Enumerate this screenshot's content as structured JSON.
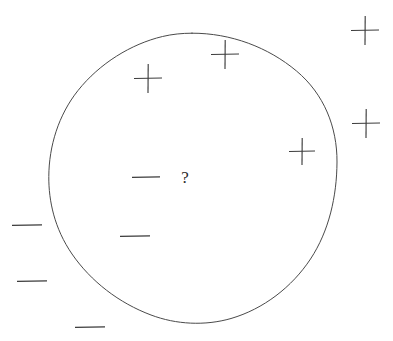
{
  "figure": {
    "width": 393,
    "height": 341,
    "background_color": "#ffffff",
    "stroke_color": "#3c3c3c",
    "boundary_color": "#4a4a4a"
  },
  "boundary": {
    "shape": "circle",
    "label": "concept-boundary",
    "center_x": 192,
    "center_y": 178,
    "radius": 145,
    "stroke_width": 1
  },
  "query": {
    "symbol": "?",
    "x": 185,
    "y": 183,
    "font_size": 17,
    "inside_boundary": true
  },
  "plus_marks": [
    {
      "name": "plus-inside-upper-left",
      "x": 148,
      "y": 78,
      "arm": 14,
      "inside_boundary": true
    },
    {
      "name": "plus-inside-top",
      "x": 225,
      "y": 54,
      "arm": 14,
      "inside_boundary": true
    },
    {
      "name": "plus-inside-right",
      "x": 302,
      "y": 151,
      "arm": 13,
      "inside_boundary": true
    },
    {
      "name": "plus-outside-top-right",
      "x": 365,
      "y": 30,
      "arm": 14,
      "inside_boundary": false
    },
    {
      "name": "plus-outside-right",
      "x": 366,
      "y": 123,
      "arm": 14,
      "inside_boundary": false
    }
  ],
  "minus_marks": [
    {
      "name": "minus-inside-center",
      "x": 146,
      "y": 177,
      "half_width": 14,
      "inside_boundary": true
    },
    {
      "name": "minus-inside-lower-left",
      "x": 135,
      "y": 236,
      "half_width": 15,
      "inside_boundary": true
    },
    {
      "name": "minus-outside-left-upper",
      "x": 27,
      "y": 225,
      "half_width": 15,
      "inside_boundary": false
    },
    {
      "name": "minus-outside-left-lower",
      "x": 32,
      "y": 281,
      "half_width": 15,
      "inside_boundary": false
    },
    {
      "name": "minus-outside-bottom",
      "x": 90,
      "y": 327,
      "half_width": 15,
      "inside_boundary": false
    }
  ],
  "counts": {
    "plus_total": 5,
    "minus_total": 5,
    "plus_inside": 3,
    "minus_inside": 2,
    "query_total": 1
  }
}
